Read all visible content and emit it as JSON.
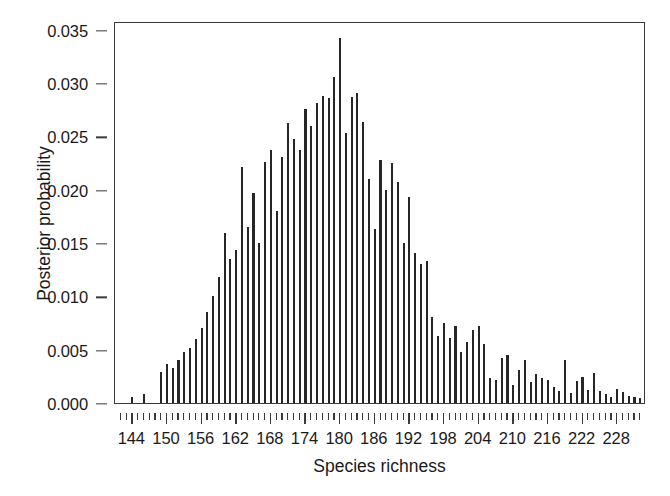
{
  "chart_data": {
    "type": "bar",
    "title": "",
    "subtitle": "",
    "xlabel": "Species richness",
    "ylabel": "Posterior probability",
    "xlim": [
      141,
      233
    ],
    "ylim": [
      0.0,
      0.0358
    ],
    "grid": false,
    "legend": null,
    "annotations": [],
    "x_major_ticks": [
      144,
      150,
      156,
      162,
      168,
      174,
      180,
      186,
      192,
      198,
      204,
      210,
      216,
      222,
      228
    ],
    "x_major_tick_labels": [
      "144",
      "150",
      "156",
      "162",
      "168",
      "174",
      "180",
      "186",
      "192",
      "198",
      "204",
      "210",
      "216",
      "222",
      "228"
    ],
    "x_minor_tick_step": 1,
    "y_ticks": [
      0.0,
      0.005,
      0.01,
      0.015,
      0.02,
      0.025,
      0.03,
      0.035
    ],
    "y_tick_labels": [
      "0.000",
      "0.005",
      "0.010",
      "0.015",
      "0.020",
      "0.025",
      "0.030",
      "0.035"
    ],
    "bar_color": "#262626",
    "frame_color": "#3a3a3a",
    "categories": [
      144,
      145,
      146,
      147,
      148,
      149,
      150,
      151,
      152,
      153,
      154,
      155,
      156,
      157,
      158,
      159,
      160,
      161,
      162,
      163,
      164,
      165,
      166,
      167,
      168,
      169,
      170,
      171,
      172,
      173,
      174,
      175,
      176,
      177,
      178,
      179,
      180,
      181,
      182,
      183,
      184,
      185,
      186,
      187,
      188,
      189,
      190,
      191,
      192,
      193,
      194,
      195,
      196,
      197,
      198,
      199,
      200,
      201,
      202,
      203,
      204,
      205,
      206,
      207,
      208,
      209,
      210,
      211,
      212,
      213,
      214,
      215,
      216,
      217,
      218,
      219,
      220,
      221,
      222,
      223,
      224,
      225,
      226,
      227,
      228,
      229,
      230,
      231,
      232
    ],
    "values": [
      0.0006,
      0.0,
      0.0008,
      0.0,
      0.0,
      0.0029,
      0.0037,
      0.0033,
      0.004,
      0.0048,
      0.0052,
      0.006,
      0.007,
      0.0085,
      0.01,
      0.0118,
      0.0159,
      0.0135,
      0.0143,
      0.0221,
      0.0165,
      0.0197,
      0.015,
      0.0226,
      0.0237,
      0.018,
      0.0231,
      0.0262,
      0.0247,
      0.0237,
      0.0276,
      0.026,
      0.0281,
      0.0288,
      0.0286,
      0.0306,
      0.0342,
      0.0253,
      0.0287,
      0.0291,
      0.0263,
      0.021,
      0.0163,
      0.0228,
      0.02,
      0.0225,
      0.0207,
      0.015,
      0.0193,
      0.0141,
      0.013,
      0.0133,
      0.0081,
      0.0063,
      0.0075,
      0.0061,
      0.0072,
      0.0048,
      0.0057,
      0.0068,
      0.0072,
      0.0055,
      0.0023,
      0.0022,
      0.0042,
      0.0045,
      0.0017,
      0.0031,
      0.004,
      0.002,
      0.0027,
      0.0023,
      0.0022,
      0.0015,
      0.0011,
      0.004,
      0.0009,
      0.0021,
      0.0024,
      0.0012,
      0.0028,
      0.0011,
      0.0008,
      0.0006,
      0.0013,
      0.001,
      0.0007,
      0.0006,
      0.0005
    ]
  }
}
